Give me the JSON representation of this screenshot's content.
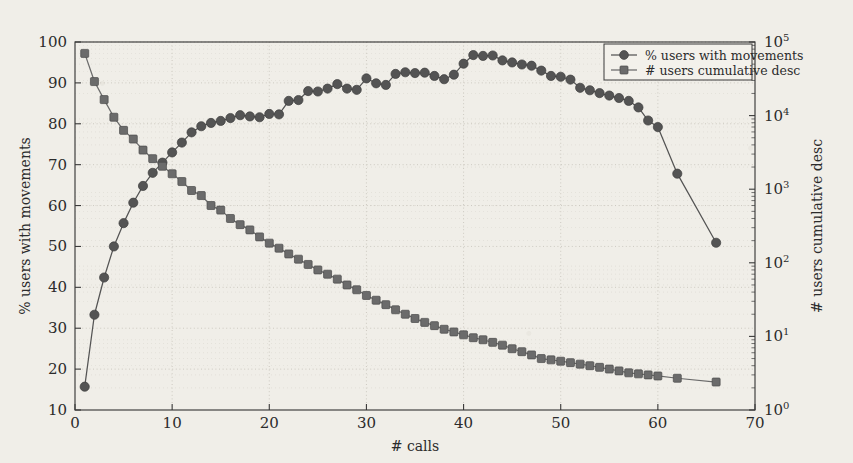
{
  "chart_data": {
    "type": "line",
    "title": "",
    "xlabel": "# calls",
    "ylabel": "% users with movements",
    "y2label": "# users cumulative desc",
    "xlim": [
      0,
      70
    ],
    "ylim": [
      10,
      100
    ],
    "y2lim": [
      1,
      100000
    ],
    "y2scale": "log",
    "grid": true,
    "legend_position": "top-right",
    "xticks": [
      "0",
      "10",
      "20",
      "30",
      "40",
      "50",
      "60",
      "70"
    ],
    "xtick_values": [
      0,
      10,
      20,
      30,
      40,
      50,
      60,
      70
    ],
    "yticks": [
      "10",
      "20",
      "30",
      "40",
      "50",
      "60",
      "70",
      "80",
      "90",
      "100"
    ],
    "ytick_values": [
      10,
      20,
      30,
      40,
      50,
      60,
      70,
      80,
      90,
      100
    ],
    "y2ticks": [
      "10^0",
      "10^1",
      "10^2",
      "10^3",
      "10^4",
      "10^5"
    ],
    "y2tick_values": [
      1,
      10,
      100,
      1000,
      10000,
      100000
    ],
    "series": [
      {
        "name": "% users with movements",
        "marker": "circle",
        "axis": "left",
        "color": "#545454",
        "x": [
          1,
          2,
          3,
          4,
          5,
          6,
          7,
          8,
          9,
          10,
          11,
          12,
          13,
          14,
          15,
          16,
          17,
          18,
          19,
          20,
          21,
          22,
          23,
          24,
          25,
          26,
          27,
          28,
          29,
          30,
          31,
          32,
          33,
          34,
          35,
          36,
          37,
          38,
          39,
          40,
          41,
          42,
          43,
          44,
          45,
          46,
          47,
          48,
          49,
          50,
          51,
          52,
          53,
          54,
          55,
          56,
          57,
          58,
          59,
          60,
          62,
          66
        ],
        "values": [
          15.7,
          33.3,
          42.4,
          50.0,
          55.7,
          60.7,
          64.8,
          68.0,
          70.5,
          73.0,
          75.4,
          77.9,
          79.4,
          80.2,
          80.7,
          81.4,
          82.1,
          81.8,
          81.6,
          82.4,
          82.3,
          85.6,
          85.8,
          88.0,
          87.9,
          88.6,
          89.7,
          88.6,
          88.3,
          91.1,
          89.9,
          89.5,
          92.2,
          92.6,
          92.4,
          92.5,
          91.7,
          90.9,
          92.0,
          94.7,
          96.8,
          96.6,
          96.7,
          95.5,
          95.0,
          94.5,
          94.2,
          93.0,
          91.7,
          91.5,
          90.8,
          88.8,
          88.2,
          87.5,
          86.9,
          86.3,
          85.6,
          84.0,
          80.8,
          79.2,
          67.8,
          50.9
        ]
      },
      {
        "name": "# users cumulative desc",
        "marker": "square",
        "axis": "right",
        "color": "#6b6b6b",
        "x": [
          1,
          2,
          3,
          4,
          5,
          6,
          7,
          8,
          9,
          10,
          11,
          12,
          13,
          14,
          15,
          16,
          17,
          18,
          19,
          20,
          21,
          22,
          23,
          24,
          25,
          26,
          27,
          28,
          29,
          30,
          31,
          32,
          33,
          34,
          35,
          36,
          37,
          38,
          39,
          40,
          41,
          42,
          43,
          44,
          45,
          46,
          47,
          48,
          49,
          50,
          51,
          52,
          53,
          54,
          55,
          56,
          57,
          58,
          59,
          60,
          62,
          66
        ],
        "values": [
          70000,
          29000,
          16500,
          9500,
          6300,
          4800,
          3400,
          2600,
          2050,
          1620,
          1270,
          960,
          820,
          600,
          520,
          400,
          330,
          280,
          225,
          185,
          158,
          132,
          112,
          95,
          80,
          70,
          60,
          50,
          43,
          36,
          31,
          27,
          23,
          20,
          17.5,
          15.5,
          14,
          12.5,
          11.5,
          10.5,
          9.6,
          9.0,
          8.3,
          7.6,
          6.8,
          6.2,
          5.6,
          5.0,
          4.8,
          4.6,
          4.4,
          4.2,
          4.0,
          3.8,
          3.6,
          3.4,
          3.2,
          3.1,
          3.0,
          2.9,
          2.7,
          2.4
        ]
      }
    ]
  },
  "legend": {
    "items": [
      {
        "label": "% users with movements",
        "marker": "circle"
      },
      {
        "label": "# users cumulative desc",
        "marker": "square"
      }
    ]
  },
  "axes": {
    "x_label": "# calls",
    "y_left_label": "% users with movements",
    "y_right_label": "# users cumulative desc"
  },
  "colors": {
    "background": "#f0eee8",
    "axis": "#3a3a3a",
    "grid": "#c9c6bd",
    "series_circle": "#545454",
    "series_square": "#6b6b6b",
    "text": "#2b2b2b"
  }
}
